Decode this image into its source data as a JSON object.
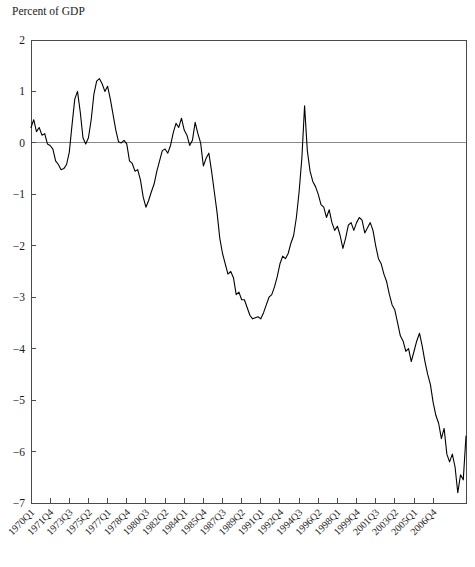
{
  "chart_data": {
    "type": "line",
    "title": "Percent of GDP",
    "xlabel": "",
    "ylabel": "Percent of GDP",
    "ylim": [
      -7,
      2
    ],
    "yticks": [
      2,
      1,
      0,
      -1,
      -2,
      -3,
      -4,
      -5,
      -6,
      -7
    ],
    "ytick_labels": [
      "2",
      "1",
      "0",
      "−1",
      "−2",
      "−3",
      "−4",
      "−5",
      "−6",
      "−7"
    ],
    "grid": false,
    "legend": "none",
    "zero_line": true,
    "line_color": "#000000",
    "axis_color": "#4a4a4a",
    "xtick_labels": [
      "1970Q1",
      "1971Q4",
      "1973Q3",
      "1975Q2",
      "1977Q1",
      "1978Q4",
      "1980Q3",
      "1982Q2",
      "1984Q1",
      "1985Q4",
      "1987Q3",
      "1989Q2",
      "1991Q1",
      "1992Q4",
      "1994Q3",
      "1996Q2",
      "1998Q1",
      "1999Q4",
      "2001Q3",
      "2003Q2",
      "2005Q1",
      "2006Q4"
    ],
    "xtick_indices": [
      0,
      7,
      14,
      21,
      28,
      35,
      42,
      49,
      56,
      63,
      70,
      77,
      84,
      91,
      98,
      105,
      112,
      119,
      126,
      133,
      140,
      147
    ],
    "x_first": "1970Q1",
    "x_last": "2006Q4",
    "n_points": 148,
    "series": [
      {
        "name": "Current account balance",
        "values": [
          0.3,
          0.45,
          0.22,
          0.3,
          0.15,
          0.18,
          -0.02,
          -0.05,
          -0.12,
          -0.35,
          -0.42,
          -0.52,
          -0.5,
          -0.42,
          -0.18,
          0.35,
          0.85,
          1.0,
          0.6,
          0.1,
          -0.02,
          0.1,
          0.45,
          0.95,
          1.2,
          1.25,
          1.15,
          1.0,
          1.1,
          0.85,
          0.55,
          0.25,
          0.02,
          0.0,
          0.05,
          -0.02,
          -0.35,
          -0.4,
          -0.55,
          -0.52,
          -0.72,
          -1.05,
          -1.25,
          -1.12,
          -0.95,
          -0.8,
          -0.55,
          -0.35,
          -0.15,
          -0.12,
          -0.2,
          -0.05,
          0.2,
          0.38,
          0.3,
          0.48,
          0.25,
          0.15,
          -0.05,
          0.05,
          0.4,
          0.18,
          0.0,
          -0.45,
          -0.3,
          -0.2,
          -0.55,
          -0.95,
          -1.35,
          -1.85,
          -2.15,
          -2.35,
          -2.55,
          -2.5,
          -2.62,
          -2.95,
          -2.9,
          -3.05,
          -3.05,
          -3.2,
          -3.35,
          -3.42,
          -3.4,
          -3.38,
          -3.42,
          -3.3,
          -3.15,
          -3.0,
          -2.95,
          -2.8,
          -2.6,
          -2.35,
          -2.2,
          -2.25,
          -2.15,
          -1.95,
          -1.8,
          -1.45,
          -0.95,
          -0.3,
          0.72,
          -0.15,
          -0.55,
          -0.75,
          -0.85,
          -1.0,
          -1.2,
          -1.25,
          -1.45,
          -1.3,
          -1.55,
          -1.7,
          -1.62,
          -1.8,
          -2.05,
          -1.85,
          -1.6,
          -1.55,
          -1.7,
          -1.55,
          -1.45,
          -1.5,
          -1.75,
          -1.65,
          -1.55,
          -1.7,
          -2.0,
          -2.25,
          -2.35,
          -2.55,
          -2.7,
          -2.95,
          -3.15,
          -3.25,
          -3.5,
          -3.75,
          -3.85,
          -4.05,
          -4.0,
          -4.25,
          -4.05,
          -3.85,
          -3.7,
          -3.95,
          -4.25,
          -4.5,
          -4.7,
          -5.05,
          -5.3,
          -5.45,
          -5.75,
          -5.55,
          -6.05,
          -6.2,
          -6.05,
          -6.3,
          -6.8,
          -6.45,
          -6.55,
          -5.7
        ]
      }
    ]
  },
  "plot_geometry": {
    "left": 31,
    "right": 466,
    "top": 40,
    "bottom": 503
  }
}
